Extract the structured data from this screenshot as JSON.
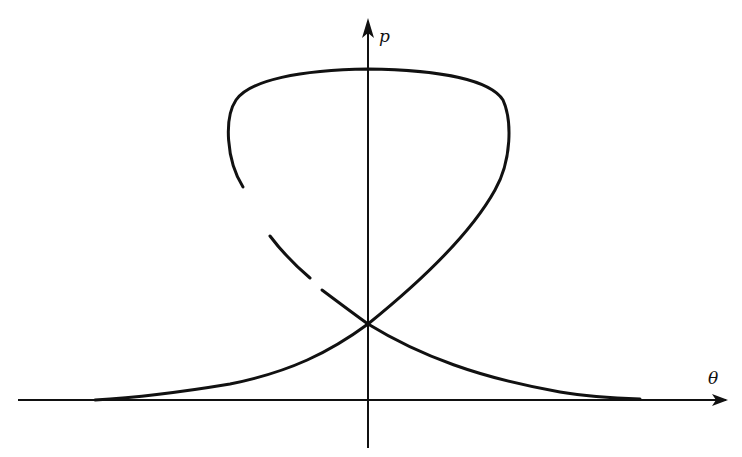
{
  "figure": {
    "type": "phase-portrait",
    "ink_color": "#111111",
    "background_color": "#ffffff"
  },
  "axes": {
    "x_label": "θ",
    "y_label": "p",
    "origin_px": [
      368,
      400
    ],
    "x_axis_px": {
      "from": [
        18,
        400
      ],
      "to": [
        728,
        400
      ]
    },
    "y_axis_px": {
      "from": [
        368,
        448
      ],
      "to": [
        368,
        20
      ]
    }
  },
  "curves": [
    {
      "name": "upper-loop",
      "style": "solid"
    },
    {
      "name": "left-descending-branch",
      "style": "broken (two gaps)"
    },
    {
      "name": "rising-branch-from-left-asymptote",
      "style": "solid"
    },
    {
      "name": "falling-branch-to-right-asymptote",
      "style": "solid"
    }
  ],
  "crossing_point_px": [
    368,
    324
  ]
}
